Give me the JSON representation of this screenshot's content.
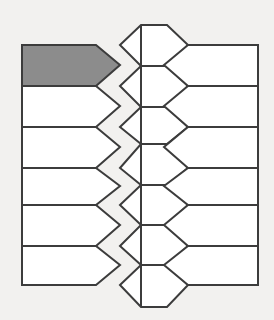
{
  "figure": {
    "title": "Hexagonal tessellation grid",
    "type": "diagram",
    "kind": "honeycomb-lattice",
    "background_color": "#f2f1ef",
    "cell_fill_color": "#ffffff",
    "highlight_fill_color": "#8c8c8c",
    "stroke_color": "#3c3c3c",
    "stroke_width": 2,
    "geometry": {
      "left_boundary_x": 22,
      "right_boundary_x": 258,
      "center_axis_x": 141,
      "left_vertex_x": 96,
      "right_vertex_x": 188,
      "row_pitch": 41,
      "half_pitch": 20.5,
      "outer_column_top_y": 45,
      "outer_column_bottom_y": 285,
      "center_column_top_y": 25,
      "center_column_bottom_y": 307
    },
    "columns": [
      {
        "name": "left-column",
        "cell_count": 6,
        "cell_shape": "pentagon",
        "flat_edge_side": "left",
        "point_side": "right",
        "row_boundaries_y": [
          45,
          86,
          127,
          168,
          205,
          246,
          285
        ],
        "point_y": [
          65,
          106,
          147,
          186,
          225,
          265
        ]
      },
      {
        "name": "center-column",
        "cell_count": 7,
        "cell_shape": "hexagon",
        "row_boundaries_y": [
          25,
          66,
          107,
          144,
          185,
          225,
          265,
          307
        ],
        "left_vertex_y": [
          45,
          86,
          127,
          168,
          205,
          246,
          285
        ],
        "right_vertex_y": [
          45,
          86,
          127,
          168,
          205,
          246,
          285
        ]
      },
      {
        "name": "right-column",
        "cell_count": 6,
        "cell_shape": "pentagon",
        "flat_edge_side": "right",
        "point_side": "left",
        "row_boundaries_y": [
          45,
          86,
          127,
          168,
          205,
          246,
          285
        ],
        "point_y": [
          65,
          106,
          147,
          186,
          225,
          265
        ]
      }
    ],
    "highlighted_cell": {
      "column": "left-column",
      "row_index": 0,
      "label": "shaded-cell",
      "fill": "#8c8c8c",
      "position": "top-left",
      "shape": "pentagon"
    },
    "counts": {
      "total_cells": 19,
      "shaded_cells": 1,
      "unshaded_cells": 18
    }
  }
}
